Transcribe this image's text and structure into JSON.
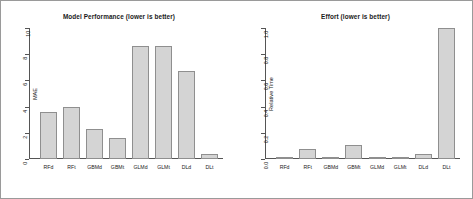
{
  "figure": {
    "background": "#ffffff",
    "border_color": "#9a9a9a",
    "bar_fill": "#d4d4d4",
    "bar_border": "#8f8f8f"
  },
  "chart_data": [
    {
      "type": "bar",
      "title": "Model Performance (lower is better)",
      "xlabel": "",
      "ylabel": "MAE",
      "categories": [
        "RFd",
        "RFt",
        "GBMd",
        "GBMt",
        "GLMd",
        "GLMt",
        "DLd",
        "DLt"
      ],
      "values": [
        3.6,
        4.0,
        2.3,
        1.6,
        8.6,
        8.6,
        6.7,
        0.35
      ],
      "ylim": [
        0,
        10
      ],
      "yticks": [
        0,
        2,
        4,
        6,
        8,
        10
      ],
      "ytick_labels": [
        "0",
        "2",
        "4",
        "6",
        "8",
        "10"
      ],
      "grid": false,
      "legend": "none"
    },
    {
      "type": "bar",
      "title": "Effort (lower is better)",
      "xlabel": "",
      "ylabel": "Relative Time",
      "categories": [
        "RFd",
        "RFt",
        "GBMd",
        "GBMt",
        "GLMd",
        "GLMt",
        "DLd",
        "DLt"
      ],
      "values": [
        0.012,
        0.075,
        0.012,
        0.105,
        0.012,
        0.012,
        0.04,
        1.0
      ],
      "ylim": [
        0,
        1.0
      ],
      "yticks": [
        0.0,
        0.2,
        0.4,
        0.6,
        0.8,
        1.0
      ],
      "ytick_labels": [
        "0.0",
        "0.2",
        "0.4",
        "0.6",
        "0.8",
        "1.0"
      ],
      "grid": false,
      "legend": "none"
    }
  ]
}
